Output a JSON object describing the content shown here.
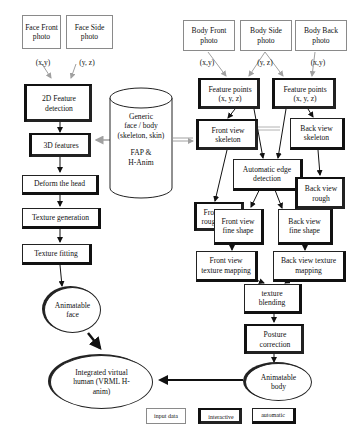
{
  "inputs": {
    "face_front": "Face Front photo",
    "face_side": "Face Side photo",
    "body_front": "Body Front photo",
    "body_side": "Body Side photo",
    "body_back": "Body Back photo"
  },
  "coord_labels": {
    "face_front": "(x,y)",
    "face_side": "(y, z)",
    "body_front": "(x,y)",
    "body_side": "(y, z)",
    "body_back": "(x,y)"
  },
  "face_pipeline": {
    "feature_2d": "2D Feature detection",
    "features_3d": "3D features",
    "deform": "Deform the head",
    "texture_gen": "Texture generation",
    "texture_fit": "Texture fitting",
    "animatable_face": "Animatable face"
  },
  "generic_db": {
    "line1": "Generic",
    "line2": "face / body",
    "line3": "(skeleton, skin)",
    "line4": "FAP &",
    "line5": "H-Anim"
  },
  "body_pipeline": {
    "feature_points_front": "Feature points (x, y, z)",
    "feature_points_back": "Feature points (x, y, z)",
    "front_skeleton": "Front view skeleton",
    "back_skeleton": "Back view skeleton",
    "auto_edge": "Automatic edge detection",
    "front_rough": "Front view rough shape",
    "back_rough": "Back view rough",
    "front_fine": "Front view fine shape",
    "back_fine": "Back view fine shape",
    "front_texture": "Front view texture mapping",
    "back_texture": "Back view texture mapping",
    "texture_blending": "texture blending",
    "posture": "Posture correction",
    "animatable_body": "Animatable body"
  },
  "output": {
    "integrated": "Integrated virtual human (VRML H-anim)"
  },
  "legend": {
    "input_data": "input data",
    "interactive": "interactive",
    "automatic": "automatic"
  },
  "colors": {
    "input_border": "#8a8a8a",
    "node_border": "#222222",
    "arrow_gray": "#a0a0a0",
    "arrow_dark": "#111111"
  }
}
